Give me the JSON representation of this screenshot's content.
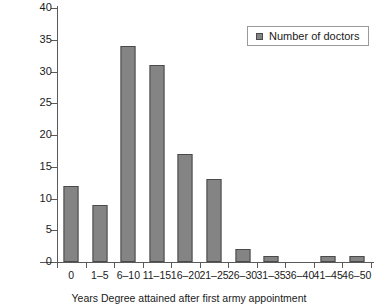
{
  "chart_data": {
    "type": "bar",
    "title": "",
    "subtitle": "",
    "xlabel": "Years Degree attained after first army appointment",
    "ylabel": "",
    "categories": [
      "0",
      "1–5",
      "6–10",
      "11–15",
      "16–20",
      "21–25",
      "26–30",
      "31–35",
      "36–40",
      "41–45",
      "46–50"
    ],
    "values": [
      12,
      9,
      34,
      31,
      17,
      13,
      2,
      1,
      0,
      1,
      1
    ],
    "series": [
      {
        "name": "Number of doctors",
        "values": [
          12,
          9,
          34,
          31,
          17,
          13,
          2,
          1,
          0,
          1,
          1
        ]
      }
    ],
    "ylim": [
      0,
      40
    ],
    "ytick_step": 5,
    "yticks": [
      "0",
      "5",
      "10",
      "15",
      "20",
      "25",
      "30",
      "35",
      "40"
    ],
    "grid": false,
    "legend": {
      "position": "top-right",
      "entries": [
        {
          "label": "Number of doctors",
          "color": "#848484"
        }
      ]
    },
    "colors": {
      "bar_fill": "#848484",
      "bar_stroke": "#4a4a4a",
      "axis": "#5a5a5a",
      "text": "#1a1a1a",
      "legend_border": "#9a9a9a",
      "background": "#ffffff"
    }
  }
}
